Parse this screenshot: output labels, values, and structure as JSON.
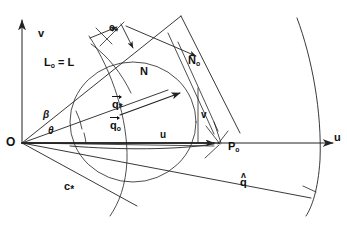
{
  "figure": {
    "kind": "vector-geometry-diagram",
    "stroke_color": "#222222",
    "background_color": "#ffffff"
  },
  "axes": {
    "vertical": {
      "label": "v",
      "arrow": "up"
    },
    "horizontal": {
      "label": "u",
      "arrow": "right"
    },
    "origin_label": "O"
  },
  "points": [
    {
      "id": "origin",
      "label": "O",
      "x": 18,
      "y": 143
    },
    {
      "id": "P0",
      "label": "P",
      "sub": "o",
      "x": 224,
      "y": 147
    }
  ],
  "angles": [
    {
      "id": "beta",
      "label": "β",
      "x": 44,
      "y": 117
    },
    {
      "id": "theta",
      "label": "θ",
      "x": 48,
      "y": 131
    }
  ],
  "labels": {
    "L0_equals_L": {
      "text": "L",
      "sub": "o",
      "rest": "= L"
    },
    "q_star": {
      "base": "q",
      "star": "*"
    },
    "q_zero": {
      "base": "q",
      "sub": "o"
    },
    "N": {
      "text": "N"
    },
    "N_zero": {
      "base": "N",
      "sub": "o"
    },
    "c_star": {
      "base": "c",
      "star": "*"
    },
    "q_hat": {
      "base": "q",
      "hat": "ʌ"
    },
    "v_component": {
      "text": "v"
    },
    "u_component": {
      "text": "u"
    },
    "c_star_top": {
      "base": "c",
      "star": "*"
    }
  },
  "curves": [
    {
      "id": "outer-arc-right",
      "name": "far-characteristic-arc"
    },
    {
      "id": "main-circle",
      "name": "velocity-circle"
    },
    {
      "id": "small-arc-top",
      "name": "near-characteristic-arc"
    },
    {
      "id": "lower-arc",
      "name": "lower-characteristic-arc"
    }
  ]
}
